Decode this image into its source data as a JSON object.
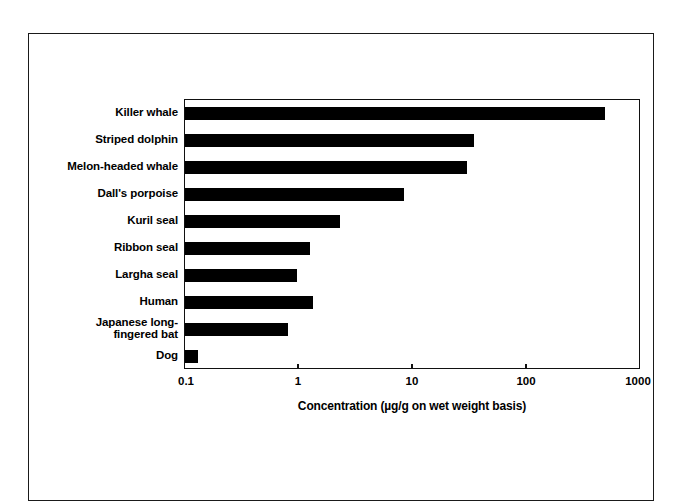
{
  "figure": {
    "border_color": "#1a1a1a",
    "background": "#ffffff"
  },
  "chart_data": {
    "type": "bar",
    "orientation": "horizontal",
    "title": "",
    "subtitle": "",
    "xlabel": "Concentration (µg/g on wet weight basis)",
    "ylabel": "",
    "xscale": "log",
    "xlim": [
      0.1,
      1000
    ],
    "xticks": [
      0.1,
      1,
      10,
      100,
      1000
    ],
    "xticklabels": [
      "0.1",
      "1",
      "10",
      "100",
      "1000"
    ],
    "grid": false,
    "legend": null,
    "bar_color": "#000000",
    "categories": [
      "Killer whale",
      "Striped dolphin",
      "Melon-headed whale",
      "Dall's porpoise",
      "Kuril seal",
      "Ribbon seal",
      "Largha seal",
      "Human",
      "Japanese long-\nfingered bat",
      "Dog"
    ],
    "values": [
      480,
      34,
      30,
      8.3,
      2.3,
      1.25,
      0.96,
      1.33,
      0.8,
      0.13
    ]
  }
}
